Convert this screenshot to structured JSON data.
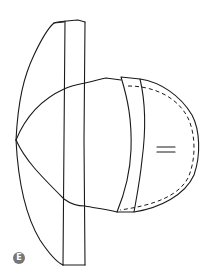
{
  "figure": {
    "label": "E",
    "label_color": "#777777",
    "line_color": "#1a1a1a",
    "background": "#ffffff",
    "parts": [
      "brim-outer-edge",
      "brim-band",
      "crown-seam",
      "side-band",
      "crown-outer-edge",
      "stitch-line",
      "grain-marks"
    ]
  }
}
